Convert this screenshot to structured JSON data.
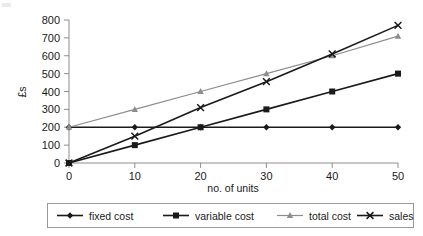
{
  "chart_data": {
    "type": "line",
    "title": "",
    "xlabel": "no. of units",
    "ylabel": "£s",
    "x": [
      0,
      10,
      20,
      30,
      40,
      50
    ],
    "xtick_labels": [
      "0",
      "10",
      "20",
      "30",
      "40",
      "50"
    ],
    "ytick_labels": [
      "0",
      "100",
      "200",
      "300",
      "400",
      "500",
      "600",
      "700",
      "800"
    ],
    "xlim": [
      0,
      50
    ],
    "ylim": [
      0,
      800
    ],
    "grid": false,
    "legend_position": "bottom",
    "series": [
      {
        "name": "fixed cost",
        "values": [
          200,
          200,
          200,
          200,
          200,
          200
        ],
        "color": "#1a1a1a",
        "marker": "diamond"
      },
      {
        "name": "variable cost",
        "values": [
          0,
          100,
          200,
          300,
          400,
          500
        ],
        "color": "#1a1a1a",
        "marker": "square"
      },
      {
        "name": "total cost",
        "values": [
          200,
          300,
          400,
          500,
          600,
          710
        ],
        "color": "#8d8d8d",
        "marker": "triangle"
      },
      {
        "name": "sales",
        "values": [
          0,
          150,
          310,
          455,
          610,
          770
        ],
        "color": "#1a1a1a",
        "marker": "cross"
      }
    ]
  },
  "axes": {
    "y_axis_label": "£s",
    "x_axis_label": "no. of units"
  },
  "legend": {
    "items": [
      {
        "label": "fixed cost",
        "marker": "diamond-marker",
        "color": "#1a1a1a"
      },
      {
        "label": "variable cost",
        "marker": "square-marker",
        "color": "#1a1a1a"
      },
      {
        "label": "total cost",
        "marker": "triangle-marker",
        "color": "#8d8d8d"
      },
      {
        "label": "sales",
        "marker": "cross-marker",
        "color": "#1a1a1a"
      }
    ]
  }
}
